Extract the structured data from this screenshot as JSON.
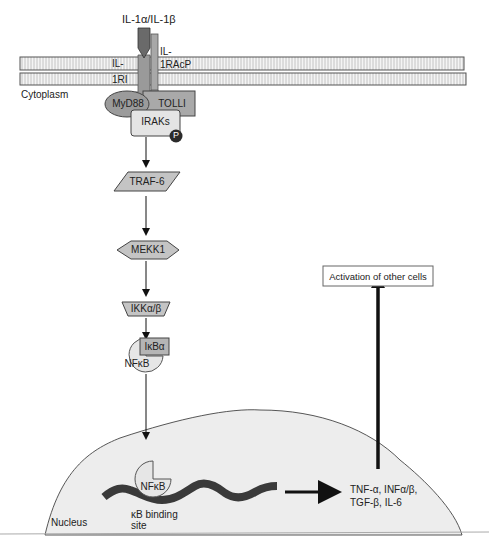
{
  "diagram": {
    "type": "signaling-pathway",
    "ligand": "IL-1α/IL-1β",
    "receptor_1_line1": "IL-",
    "receptor_1_line2": "1RI",
    "receptor_2_line1": "IL-",
    "receptor_2_line2": "1RAcP",
    "compartments": {
      "cytoplasm": "Cytoplasm",
      "nucleus": "Nucleus"
    },
    "nodes": {
      "myd88": "MyD88",
      "tolli": "TOLLI",
      "iraks": "IRAKs",
      "phospho": "P",
      "traf6": "TRAF-6",
      "mekk1": "MEKK1",
      "ikk": "IKKα/β",
      "ikba": "IκBα",
      "nfkb_cyto": "NFκB",
      "nfkb_nuc": "NFκB"
    },
    "binding_site_line1": "κB binding",
    "binding_site_line2": "site",
    "products_line1": "TNF-α, INFα/β,",
    "products_line2": "TGF-β, IL-6",
    "outcome": "Activation of other cells",
    "colors": {
      "ligand": "#6e6e6e",
      "receptor": "#9a9a9a",
      "node_fill": "#bdbdbd",
      "light_fill": "#e2e2e2",
      "nucleus_fill": "#ececec",
      "dna": "#3a3a3a",
      "phospho": "#2b2b2b"
    }
  }
}
